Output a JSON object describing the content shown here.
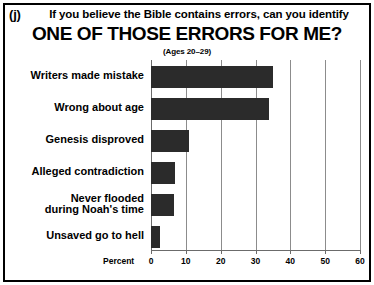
{
  "figure": {
    "panel_letter": "(j)",
    "question": "If you believe the Bible contains errors, can you identify",
    "title": "ONE OF THOSE ERRORS FOR ME?",
    "subtitle": "(Ages 20–29)",
    "bar_color": "#2b2b2b",
    "grid_color": "#8c8c8c",
    "border_color": "#000000"
  },
  "chart_data": {
    "type": "bar",
    "orientation": "horizontal",
    "title": "ONE OF THOSE ERRORS FOR ME?",
    "subtitle": "(Ages 20–29)",
    "xlabel": "Percent",
    "ylabel": "",
    "xlim": [
      0,
      60
    ],
    "xticks": [
      0,
      10,
      20,
      30,
      40,
      50,
      60
    ],
    "xtick_labels": [
      "0",
      "10",
      "20",
      "30",
      "40",
      "50",
      "60"
    ],
    "grid": true,
    "grid_axis": "x",
    "legend": false,
    "categories": [
      "Writers made mistake",
      "Wrong about age",
      "Genesis disproved",
      "Alleged contradiction",
      "Never flooded\nduring Noah's time",
      "Unsaved go to hell"
    ],
    "category_lines": [
      [
        "Writers made mistake"
      ],
      [
        "Wrong about age"
      ],
      [
        "Genesis disproved"
      ],
      [
        "Alleged contradiction"
      ],
      [
        "Never flooded",
        "during Noah's time"
      ],
      [
        "Unsaved go to hell"
      ]
    ],
    "values": [
      35,
      34,
      11,
      7,
      6.5,
      2.5
    ]
  }
}
